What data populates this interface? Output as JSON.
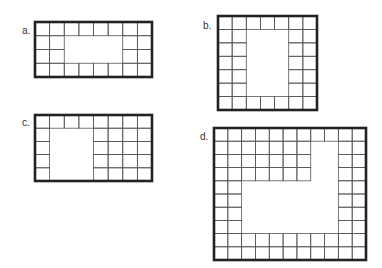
{
  "colors": {
    "line": "#555555",
    "frame": "#222222",
    "label": "#333333"
  },
  "figures": [
    {
      "id": "a",
      "label": "a.",
      "label_pos": [
        22,
        25
      ],
      "frame": {
        "x": 35,
        "y": 22,
        "w": 117,
        "h": 55
      },
      "cols": 8,
      "rows": 4,
      "mask": [
        "11111111",
        "11000011",
        "11000011",
        "11111111"
      ]
    },
    {
      "id": "b",
      "label": "b.",
      "label_pos": [
        203,
        20
      ],
      "frame": {
        "x": 218,
        "y": 16,
        "w": 99,
        "h": 94
      },
      "cols": 7,
      "rows": 7,
      "mask": [
        "1111111",
        "1100011",
        "1100011",
        "1100011",
        "1100011",
        "1100011",
        "1111111"
      ]
    },
    {
      "id": "c",
      "label": "c.",
      "label_pos": [
        22,
        117
      ],
      "frame": {
        "x": 35,
        "y": 115,
        "w": 117,
        "h": 66
      },
      "cols": 8,
      "rows": 5,
      "mask": [
        "11111111",
        "10001111",
        "10001111",
        "10001111",
        "10001111"
      ]
    },
    {
      "id": "d",
      "label": "d.",
      "label_pos": [
        200,
        131
      ],
      "frame": {
        "x": 214,
        "y": 128,
        "w": 152,
        "h": 132
      },
      "cols": 11,
      "rows": 10,
      "mask": [
        "11111111111",
        "11111110011",
        "11111110011",
        "11111110011",
        "11000000011",
        "11000000011",
        "11000000011",
        "11000000011",
        "11111111111",
        "11111111111"
      ]
    }
  ]
}
